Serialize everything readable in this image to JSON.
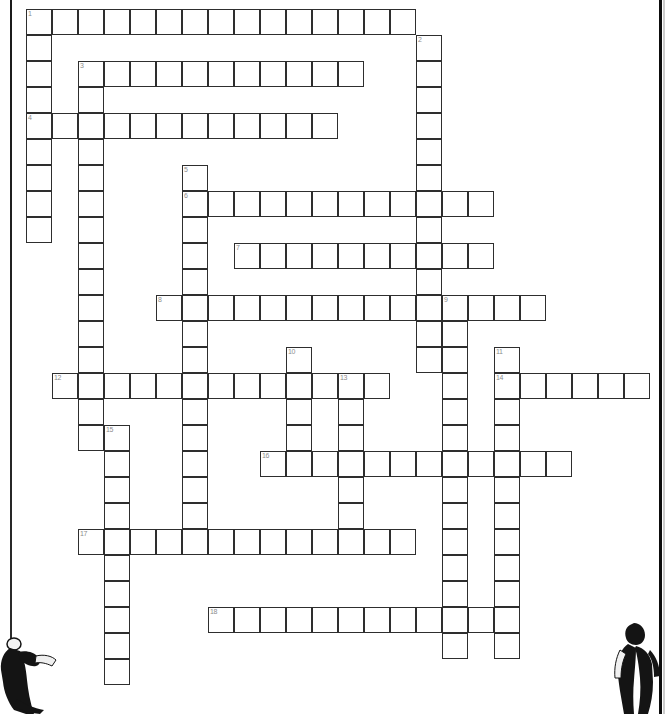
{
  "page": {
    "background_color": "#ffffff",
    "grid_line_color": "#2e2e2e",
    "number_color": "#8c8c8c",
    "figure_color": "#111111"
  },
  "grid": {
    "cell_size": 26,
    "origin_x": 26,
    "origin_y": 9,
    "columns": 25,
    "rows": 26,
    "numbered_cells": [
      {
        "number": "1",
        "col": 0,
        "row": 0
      },
      {
        "number": "2",
        "col": 15,
        "row": 1
      },
      {
        "number": "3",
        "col": 2,
        "row": 2
      },
      {
        "number": "4",
        "col": 0,
        "row": 4
      },
      {
        "number": "5",
        "col": 6,
        "row": 6
      },
      {
        "number": "6",
        "col": 6,
        "row": 7
      },
      {
        "number": "7",
        "col": 8,
        "row": 9
      },
      {
        "number": "8",
        "col": 5,
        "row": 11
      },
      {
        "number": "9",
        "col": 16,
        "row": 11
      },
      {
        "number": "10",
        "col": 10,
        "row": 13
      },
      {
        "number": "11",
        "col": 18,
        "row": 13
      },
      {
        "number": "12",
        "col": 1,
        "row": 14
      },
      {
        "number": "13",
        "col": 12,
        "row": 14
      },
      {
        "number": "14",
        "col": 18,
        "row": 14
      },
      {
        "number": "15",
        "col": 3,
        "row": 16
      },
      {
        "number": "16",
        "col": 9,
        "row": 17
      },
      {
        "number": "17",
        "col": 2,
        "row": 20
      },
      {
        "number": "18",
        "col": 7,
        "row": 23
      }
    ],
    "entries": [
      {
        "number": "1",
        "direction": "across",
        "col": 0,
        "row": 0,
        "length": 15,
        "answer": ""
      },
      {
        "number": "1",
        "direction": "down",
        "col": 0,
        "row": 0,
        "length": 9,
        "answer": ""
      },
      {
        "number": "2",
        "direction": "down",
        "col": 15,
        "row": 1,
        "length": 13,
        "answer": ""
      },
      {
        "number": "3",
        "direction": "across",
        "col": 2,
        "row": 2,
        "length": 11,
        "answer": ""
      },
      {
        "number": "3",
        "direction": "down",
        "col": 2,
        "row": 2,
        "length": 15,
        "answer": ""
      },
      {
        "number": "4",
        "direction": "across",
        "col": 0,
        "row": 4,
        "length": 12,
        "answer": ""
      },
      {
        "number": "5",
        "direction": "down",
        "col": 6,
        "row": 6,
        "length": 15,
        "answer": ""
      },
      {
        "number": "6",
        "direction": "across",
        "col": 6,
        "row": 7,
        "length": 12,
        "answer": ""
      },
      {
        "number": "7",
        "direction": "across",
        "col": 8,
        "row": 9,
        "length": 10,
        "answer": ""
      },
      {
        "number": "8",
        "direction": "across",
        "col": 5,
        "row": 11,
        "length": 15,
        "answer": ""
      },
      {
        "number": "9",
        "direction": "down",
        "col": 16,
        "row": 11,
        "length": 14,
        "answer": ""
      },
      {
        "number": "10",
        "direction": "down",
        "col": 10,
        "row": 13,
        "length": 5,
        "answer": ""
      },
      {
        "number": "11",
        "direction": "down",
        "col": 18,
        "row": 13,
        "length": 12,
        "answer": ""
      },
      {
        "number": "12",
        "direction": "across",
        "col": 1,
        "row": 14,
        "length": 13,
        "answer": ""
      },
      {
        "number": "13",
        "direction": "down",
        "col": 12,
        "row": 14,
        "length": 6,
        "answer": ""
      },
      {
        "number": "14",
        "direction": "across",
        "col": 18,
        "row": 14,
        "length": 6,
        "answer": ""
      },
      {
        "number": "15",
        "direction": "down",
        "col": 3,
        "row": 16,
        "length": 10,
        "answer": ""
      },
      {
        "number": "16",
        "direction": "across",
        "col": 9,
        "row": 17,
        "length": 12,
        "answer": ""
      },
      {
        "number": "17",
        "direction": "across",
        "col": 2,
        "row": 20,
        "length": 13,
        "answer": ""
      },
      {
        "number": "18",
        "direction": "across",
        "col": 7,
        "row": 23,
        "length": 11,
        "answer": ""
      }
    ]
  },
  "decorations": {
    "rope_line": {
      "x": 10,
      "y": 0,
      "height": 640
    },
    "pole_line": {
      "x": 659,
      "y": 0,
      "height": 714
    },
    "figures": [
      {
        "name": "person-pulling-rope",
        "x": 0,
        "y": 640,
        "width": 62,
        "height": 74
      },
      {
        "name": "person-standing",
        "x": 616,
        "y": 624,
        "width": 50,
        "height": 90
      }
    ]
  }
}
